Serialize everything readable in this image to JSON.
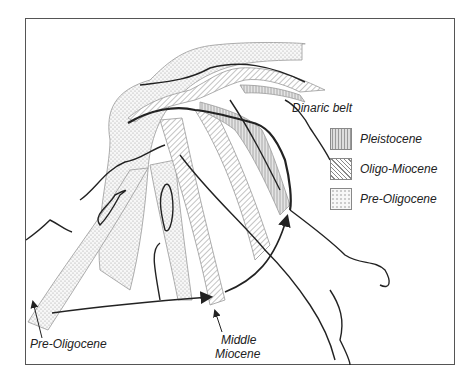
{
  "figure": {
    "type": "geological tectonic map",
    "region": "Central Mediterranean / Italian peninsula"
  },
  "labels": {
    "dinaric_belt": "Dinaric belt",
    "middle_miocene_line1": "Middle",
    "middle_miocene_line2": "Miocene",
    "pre_oligocene_bottom": "Pre-Oligocene"
  },
  "legend": {
    "items": [
      {
        "label": "Pleistocene",
        "pattern": "vertical-hatch"
      },
      {
        "label": "Oligo-Miocene",
        "pattern": "diagonal-hatch"
      },
      {
        "label": "Pre-Oligocene",
        "pattern": "dotted"
      }
    ]
  },
  "colors": {
    "coastline": "#222222",
    "belt_outline": "#999999",
    "frame": "#555555",
    "text": "#222222"
  }
}
